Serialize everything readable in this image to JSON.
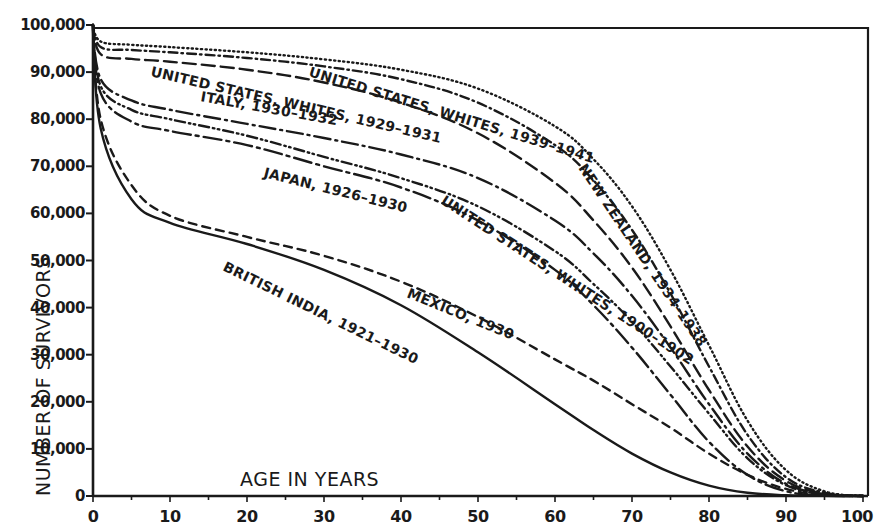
{
  "chart_data": {
    "type": "line",
    "title": "",
    "xlabel": "AGE IN YEARS",
    "ylabel": "NUMBER OF SURVIVORS",
    "xlim": [
      0,
      100
    ],
    "ylim": [
      0,
      100000
    ],
    "grid": false,
    "legend_position": "inline labels on curves",
    "x_ticks": [
      "0",
      "10",
      "20",
      "30",
      "40",
      "50",
      "60",
      "70",
      "80",
      "90",
      "100"
    ],
    "y_ticks": [
      "0",
      "10,000",
      "20,000",
      "30,000",
      "40,000",
      "50,000",
      "60,000",
      "70,000",
      "80,000",
      "90,000",
      "100,000"
    ],
    "x": [
      0,
      1,
      5,
      10,
      20,
      30,
      40,
      50,
      60,
      65,
      70,
      75,
      80,
      85,
      90,
      95,
      100
    ],
    "series": [
      {
        "name": "NEW ZEALAND, 1934-1938",
        "style": "dotted",
        "label_pos": {
          "x": 578,
          "y": 168,
          "rot": 56
        },
        "values": [
          100000,
          96500,
          95800,
          95300,
          94200,
          92700,
          90500,
          86500,
          78500,
          71500,
          61500,
          48000,
          32000,
          16000,
          5500,
          1000,
          0
        ]
      },
      {
        "name": "UNITED STATES, WHITES, 1939-1941",
        "style": "dash-dot",
        "label_pos": {
          "x": 308,
          "y": 76,
          "rot": 17
        },
        "values": [
          100000,
          95300,
          94700,
          94200,
          93000,
          91200,
          88500,
          83500,
          74500,
          67000,
          56500,
          43000,
          27500,
          13000,
          4000,
          700,
          0
        ]
      },
      {
        "name": "UNITED STATES, WHITES, 1929-1931",
        "style": "long-dash",
        "label_pos": {
          "x": 150,
          "y": 76,
          "rot": 13
        },
        "values": [
          100000,
          93800,
          92800,
          92200,
          90500,
          87800,
          83500,
          77000,
          66500,
          58500,
          48500,
          36000,
          22500,
          10500,
          3200,
          500,
          0
        ]
      },
      {
        "name": "ITALY, 1930-1932",
        "style": "dash-dot-long",
        "label_pos": {
          "x": 200,
          "y": 101,
          "rot": 10
        },
        "values": [
          100000,
          88500,
          84000,
          82000,
          79000,
          76000,
          72500,
          67500,
          58500,
          51500,
          42500,
          31500,
          19500,
          9000,
          2600,
          400,
          0
        ]
      },
      {
        "name": "UNITED STATES, WHITES, 1900-1902",
        "style": "dash-dot-dot",
        "label_pos": {
          "x": 440,
          "y": 203,
          "rot": 33
        },
        "values": [
          100000,
          87000,
          82000,
          80000,
          76500,
          72000,
          67500,
          61500,
          52000,
          45000,
          37000,
          27500,
          17500,
          8000,
          2300,
          300,
          0
        ]
      },
      {
        "name": "JAPAN, 1926-1930",
        "style": "long-dash-heavy",
        "label_pos": {
          "x": 263,
          "y": 177,
          "rot": 14
        },
        "values": [
          100000,
          85500,
          79500,
          77500,
          74500,
          70000,
          65500,
          58500,
          48000,
          40500,
          31500,
          21500,
          11500,
          4500,
          1000,
          100,
          0
        ]
      },
      {
        "name": "MEXICO, 1930",
        "style": "dashed",
        "label_pos": {
          "x": 406,
          "y": 297,
          "rot": 22
        },
        "values": [
          100000,
          80000,
          66000,
          59500,
          55000,
          51000,
          45500,
          38000,
          29000,
          24500,
          19500,
          14500,
          9000,
          4500,
          1500,
          200,
          0
        ]
      },
      {
        "name": "BRITISH INDIA, 1921-1930",
        "style": "solid",
        "label_pos": {
          "x": 222,
          "y": 270,
          "rot": 26
        },
        "values": [
          100000,
          78000,
          63000,
          58000,
          53500,
          48000,
          40500,
          30500,
          19500,
          14000,
          9000,
          5000,
          2200,
          700,
          150,
          20,
          0
        ]
      }
    ]
  }
}
